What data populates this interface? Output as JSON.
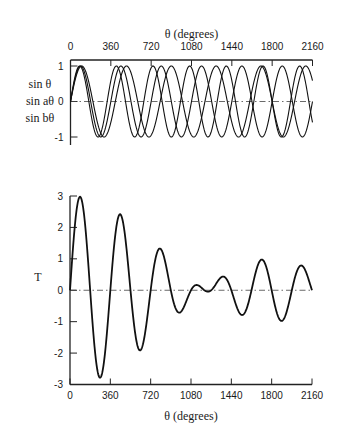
{
  "chart_data": [
    {
      "type": "line",
      "title": "",
      "xlabel": "θ (degrees)",
      "xlabel_position": "top",
      "ylabel": "",
      "series_labels": [
        "sin θ",
        "sin aθ",
        "sin bθ"
      ],
      "x_ticks": [
        0,
        360,
        720,
        1080,
        1440,
        1800,
        2160
      ],
      "y_ticks": [
        1,
        0,
        -1
      ],
      "xlim": [
        0,
        2160
      ],
      "ylim": [
        -1,
        1
      ],
      "grid": false,
      "reference_line": {
        "y": 0,
        "style": "dash-dot"
      },
      "series": [
        {
          "name": "sin θ",
          "frequency": 1.0
        },
        {
          "name": "sin aθ",
          "frequency": 1.1
        },
        {
          "name": "sin bθ",
          "frequency": 0.9
        }
      ],
      "end_values_at_2160": {
        "sin θ": 0.0,
        "sin aθ": -0.59,
        "sin bθ": 0.59
      }
    },
    {
      "type": "line",
      "title": "",
      "xlabel": "θ (degrees)",
      "xlabel_position": "bottom",
      "ylabel": "T",
      "x_ticks": [
        0,
        360,
        720,
        1080,
        1440,
        1800,
        2160
      ],
      "y_ticks": [
        3,
        2,
        1,
        0,
        -1,
        -2,
        -3
      ],
      "xlim": [
        0,
        2160
      ],
      "ylim": [
        -3,
        3
      ],
      "grid": false,
      "reference_line": {
        "y": 0,
        "style": "dash-dot"
      },
      "series": [
        {
          "name": "T = sin θ + sin aθ + sin bθ",
          "x": [
            0,
            90,
            180,
            270,
            360,
            450,
            540,
            630,
            720,
            810,
            900,
            990,
            1080,
            1170,
            1260,
            1350,
            1440,
            1530,
            1620,
            1710,
            1800,
            1890,
            1980,
            2070,
            2160
          ],
          "values": [
            0,
            2.98,
            0,
            -2.78,
            0,
            2.41,
            0,
            -1.91,
            0,
            1.31,
            0,
            -0.69,
            0,
            0.09,
            0,
            0.41,
            0,
            -0.78,
            0,
            0.98,
            0,
            -0.98,
            0,
            0.78,
            0
          ]
        }
      ]
    }
  ],
  "layout": {
    "top": {
      "x0": 70.5,
      "x1": 312.5,
      "y_top": 60,
      "y_max": 66,
      "y_min": 137,
      "y_axis_bottom": 145,
      "title_y": 38,
      "tick_label_y": 50
    },
    "bottom": {
      "x0": 70,
      "x1": 312,
      "y_max": 196,
      "y_min": 384.5,
      "tick_label_y": 399,
      "title_y": 420,
      "ylabel_x": 38,
      "ylabel_y": 281
    },
    "line_color": "#111111",
    "axis_color": "#222222"
  }
}
